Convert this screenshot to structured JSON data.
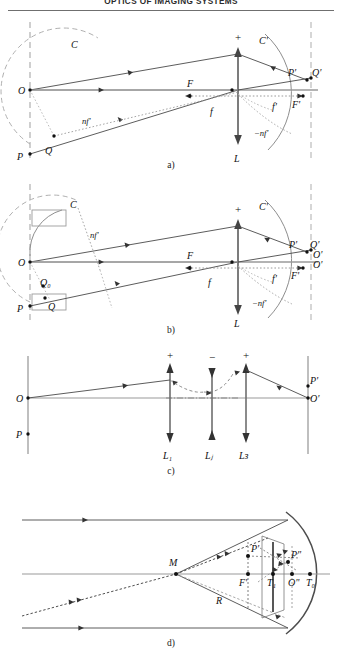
{
  "document": {
    "running_head": "OPTICS OF IMAGING SYSTEMS",
    "page_type": "figure-page"
  },
  "figure": {
    "caption_a": "a)",
    "caption_b": "b)",
    "caption_c": "c)",
    "caption_d": "d)"
  },
  "panel_a": {
    "name": "panel-a-thin-lens-nodal-construction",
    "labels": {
      "C": "C",
      "C_prime": "C'",
      "O": "O",
      "P": "P",
      "Q": "Q",
      "F": "F",
      "f": "f",
      "nf_prime": "nf'",
      "plus": "+",
      "L": "L",
      "P_prime": "P'",
      "Q_prime": "Q'",
      "f_prime": "f'",
      "F_prime": "F'",
      "minus_nf_prime": "−nf'"
    }
  },
  "panel_b": {
    "name": "panel-b-thin-lens-with-tangent-construction",
    "labels": {
      "C": "C",
      "C_prime": "C'",
      "O": "O",
      "P": "P",
      "Q": "Q",
      "Q_zero": "Q₀",
      "F": "F",
      "f": "f",
      "nf_prime": "nf'",
      "plus": "+",
      "L": "L",
      "P_prime": "P'",
      "Q_prime": "Q'",
      "O_prime_upper": "O'",
      "O_prime_lower": "O'",
      "f_prime": "f'",
      "F_prime": "F'",
      "minus_nf_prime": "−nf'"
    }
  },
  "panel_c": {
    "name": "panel-c-multi-lens-system",
    "labels": {
      "O": "O",
      "P": "P",
      "O_prime": "O'",
      "P_prime": "P'",
      "L1": "L₁",
      "Lj": "Lⱼ",
      "LJ": "Lᴈ",
      "sign_L1": "+",
      "sign_Lj": "−",
      "sign_LJ": "+"
    }
  },
  "panel_d": {
    "name": "panel-d-concave-mirror-catadioptric",
    "labels": {
      "M": "M",
      "R": "R",
      "F_prime": "F'",
      "P_prime": "P'",
      "P_dprime": "P\"",
      "T1": "T₁",
      "O_dprime": "O\"",
      "T0": "T₀"
    }
  },
  "style": {
    "ink": "#111111",
    "ray_color": "#3a3a3a",
    "dashed_color": "#9a9a9a",
    "axis_color": "#8a8a8a",
    "arc_color": "#7a7a7a",
    "background": "#ffffff"
  }
}
